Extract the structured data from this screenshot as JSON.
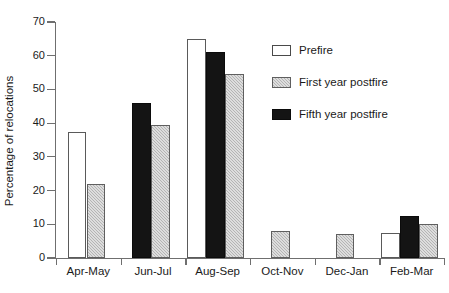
{
  "chart_data": {
    "type": "bar",
    "title": "",
    "xlabel": "",
    "ylabel": "Percentage of relocations",
    "ylim": [
      0,
      70
    ],
    "yticks": [
      0,
      10,
      20,
      30,
      40,
      50,
      60,
      70
    ],
    "ytick_labels": [
      "0",
      "10",
      "20",
      "30",
      "40",
      "50",
      "60",
      "70"
    ],
    "grid": false,
    "legend_position": "upper right",
    "categories": [
      "Apr-May",
      "Jun-Jul",
      "Aug-Sep",
      "Oct-Nov",
      "Dec-Jan",
      "Feb-Mar"
    ],
    "series": [
      {
        "name": "Prefire",
        "color": "#ffffff",
        "values": [
          37.5,
          null,
          65.0,
          null,
          null,
          7.5
        ]
      },
      {
        "name": "First year postfire",
        "color": "#b4b4b4",
        "values": [
          22.0,
          39.5,
          54.5,
          8.0,
          7.0,
          10.0
        ]
      },
      {
        "name": "Fifth year postfire",
        "color": "#141414",
        "values": [
          null,
          46.0,
          61.0,
          null,
          null,
          12.5
        ]
      }
    ],
    "bar_order_by_group": [
      [
        "Prefire",
        "First year postfire"
      ],
      [
        "Fifth year postfire",
        "First year postfire"
      ],
      [
        "Prefire",
        "Fifth year postfire",
        "First year postfire"
      ],
      [
        "First year postfire"
      ],
      [
        "First year postfire"
      ],
      [
        "Prefire",
        "Fifth year postfire",
        "First year postfire"
      ]
    ]
  },
  "axis": {
    "y_title": "Percentage of relocations",
    "y_ticks": [
      "70",
      "60",
      "50",
      "40",
      "30",
      "20",
      "10",
      "0"
    ],
    "x_categories": [
      "Apr-May",
      "Jun-Jul",
      "Aug-Sep",
      "Oct-Nov",
      "Dec-Jan",
      "Feb-Mar"
    ]
  },
  "legend": {
    "items": [
      {
        "label": "Prefire",
        "swatch": "prefire"
      },
      {
        "label": "First year postfire",
        "swatch": "first-year"
      },
      {
        "label": "Fifth year postfire",
        "swatch": "fifth-year"
      }
    ]
  },
  "colors": {
    "prefire": "#ffffff",
    "first_year": "#b4b4b4",
    "fifth_year": "#141414",
    "axis": "#6f6f6f",
    "text": "#1a1a1a"
  }
}
